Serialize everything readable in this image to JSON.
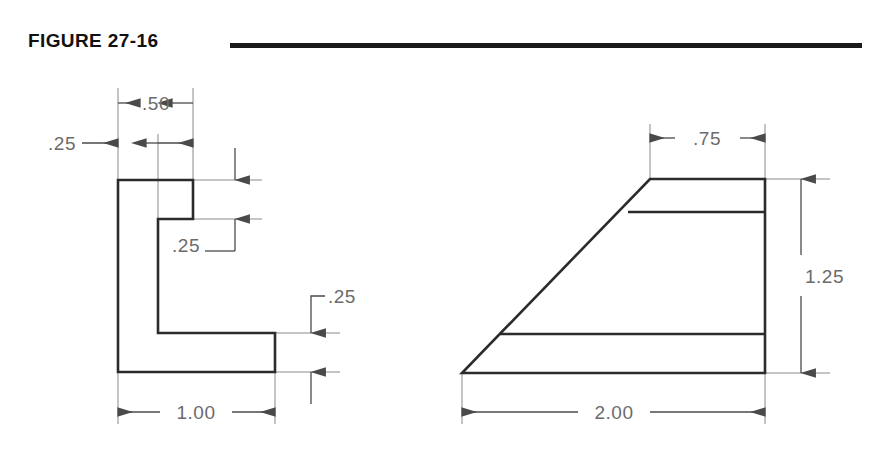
{
  "figure": {
    "title": "FIGURE 27-16",
    "rule_color": "#1a1a1a",
    "background_color": "#ffffff",
    "outline_color": "#2b2b2b",
    "dimension_color": "#6b6b6b"
  },
  "views": {
    "left": {
      "name": "L-shaped angle profile",
      "dimensions": {
        "flange_thickness_top": ".25",
        "flange_width": ".50",
        "notch_depth": ".25",
        "base_thickness": ".25",
        "overall_width": "1.00"
      }
    },
    "right": {
      "name": "Trapezoidal wedge profile",
      "dimensions": {
        "top_width": ".75",
        "height": "1.25",
        "base_width": "2.00"
      }
    }
  },
  "labels": {
    "left_025_top": ".25",
    "left_050": ".50",
    "left_025_notch": ".25",
    "left_025_base": ".25",
    "left_100": "1.00",
    "right_075": ".75",
    "right_125": "1.25",
    "right_200": "2.00"
  }
}
